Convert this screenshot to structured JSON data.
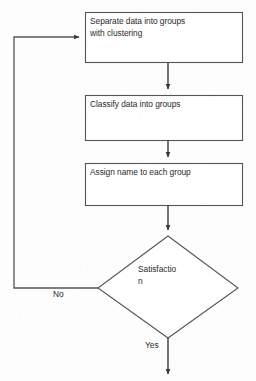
{
  "diagram": {
    "type": "flowchart",
    "title": "",
    "background_color": "#fdfdfd",
    "stroke_color": "#555555",
    "text_color": "#2b2b2b",
    "nodes": [
      {
        "id": "box-1",
        "shape": "rectangle",
        "label": "Separate data into groups\nwith clustering"
      },
      {
        "id": "box-2",
        "shape": "rectangle",
        "label": "Classify data into groups"
      },
      {
        "id": "box-3",
        "shape": "rectangle",
        "label": "Assign name to each group"
      },
      {
        "id": "decision",
        "shape": "diamond",
        "label": "Satisfactio\nn"
      }
    ],
    "edges": [
      {
        "id": "edge-1-2",
        "from": "box-1",
        "to": "box-2",
        "label": ""
      },
      {
        "id": "edge-2-3",
        "from": "box-2",
        "to": "box-3",
        "label": ""
      },
      {
        "id": "edge-3-decision",
        "from": "box-3",
        "to": "decision",
        "label": ""
      },
      {
        "id": "edge-no",
        "from": "decision",
        "to": "box-1",
        "label": "No"
      },
      {
        "id": "edge-yes",
        "from": "decision",
        "to": "exit",
        "label": "Yes"
      }
    ]
  }
}
